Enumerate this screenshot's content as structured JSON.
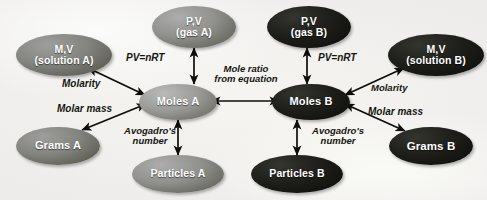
{
  "diagram": {
    "background_color": "#f2f1ee",
    "node_color_light": "#8d8d8a",
    "node_color_dark": "#1c1c18",
    "arrow_color": "#101010",
    "text_color": "#15150f"
  },
  "nodes": [
    {
      "id": "pv_gas_a",
      "line1": "P,V",
      "line2": "(gas A)",
      "tone": "tone-midlight"
    },
    {
      "id": "pv_gas_b",
      "line1": "P,V",
      "line2": "(gas B)",
      "tone": "tone-darkest"
    },
    {
      "id": "mv_solution_a",
      "line1": "M,V",
      "line2": "(solution A)",
      "tone": "tone-mid"
    },
    {
      "id": "mv_solution_b",
      "line1": "M,V",
      "line2": "(solution B)",
      "tone": "tone-darkest"
    },
    {
      "id": "moles_a",
      "line1": "Moles A",
      "line2": "",
      "tone": "tone-light"
    },
    {
      "id": "moles_b",
      "line1": "Moles B",
      "line2": "",
      "tone": "tone-darkest"
    },
    {
      "id": "grams_a",
      "line1": "Grams A",
      "line2": "",
      "tone": "tone-mid"
    },
    {
      "id": "grams_b",
      "line1": "Grams B",
      "line2": "",
      "tone": "tone-darkest"
    },
    {
      "id": "particles_a",
      "line1": "Particles A",
      "line2": "",
      "tone": "tone-midlight"
    },
    {
      "id": "particles_b",
      "line1": "Particles B",
      "line2": "",
      "tone": "tone-darkest"
    }
  ],
  "edge_labels": [
    {
      "id": "pv_nrt_a",
      "line1": "PV=nRT",
      "line2": ""
    },
    {
      "id": "pv_nrt_b",
      "line1": "PV=nRT",
      "line2": ""
    },
    {
      "id": "mole_ratio",
      "line1": "Mole ratio",
      "line2": "from equation"
    },
    {
      "id": "molarity_a",
      "line1": "Molarity",
      "line2": ""
    },
    {
      "id": "molarity_b",
      "line1": "Molarity",
      "line2": ""
    },
    {
      "id": "molar_mass_a",
      "line1": "Molar mass",
      "line2": ""
    },
    {
      "id": "molar_mass_b",
      "line1": "Molar mass",
      "line2": ""
    },
    {
      "id": "avogadro_a",
      "line1": "Avogadro's",
      "line2": "number"
    },
    {
      "id": "avogadro_b",
      "line1": "Avogadro's",
      "line2": "number"
    }
  ]
}
